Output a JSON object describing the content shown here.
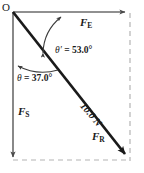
{
  "diagram": {
    "type": "force-vector-diagram",
    "origin_label": "O",
    "colors": {
      "vector_stroke": "#1a1a1a",
      "axis_stroke": "#6b6b6b",
      "dashed_stroke": "#b4b4b4",
      "arc_stroke": "#3c3c3c",
      "text": "#1a1a1a",
      "background": "#ffffff"
    },
    "vectors": [
      {
        "name": "east-force",
        "label_text": "F",
        "label_sub": "E",
        "direction": "east",
        "from": [
          13,
          12
        ],
        "to": [
          128,
          12
        ]
      },
      {
        "name": "south-force",
        "label_text": "F",
        "label_sub": "S",
        "direction": "south",
        "from": [
          13,
          12
        ],
        "to": [
          13,
          160
        ]
      },
      {
        "name": "resultant-force",
        "label_text": "F",
        "label_sub": "R",
        "direction": "southeast",
        "from": [
          13,
          12
        ],
        "to": [
          130,
          160
        ],
        "magnitude": "10.0 N"
      }
    ],
    "angles": [
      {
        "name": "theta-prime",
        "symbol": "θ′",
        "equals": "=",
        "value": "53.0°",
        "between": "east-force and resultant-force"
      },
      {
        "name": "theta",
        "symbol": "θ",
        "equals": "=",
        "value": "37.0°",
        "between": "south-force and resultant-force"
      }
    ],
    "construction_lines": [
      {
        "name": "right-dashed-vertical",
        "from": [
          130,
          12
        ],
        "to": [
          130,
          160
        ]
      },
      {
        "name": "bottom-dashed-horizontal",
        "from": [
          13,
          160
        ],
        "to": [
          130,
          160
        ]
      }
    ]
  }
}
